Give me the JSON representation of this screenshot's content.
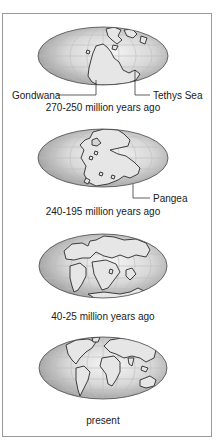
{
  "panels": [
    {
      "id": "p1",
      "caption": "270-250 million years ago",
      "labels": [
        {
          "text": "Gondwana",
          "side": "left"
        },
        {
          "text": "Tethys Sea",
          "side": "right"
        }
      ]
    },
    {
      "id": "p2",
      "caption": "240-195 million years ago",
      "labels": [
        {
          "text": "Pangea",
          "side": "right"
        }
      ]
    },
    {
      "id": "p3",
      "caption": "40-25 million years ago",
      "labels": []
    },
    {
      "id": "p4",
      "caption": "present",
      "labels": []
    }
  ],
  "colors": {
    "frame": "#9a9a9a",
    "globe_center": "#f4f4f4",
    "globe_edge": "#9c9c9c",
    "outline": "#2a2a2a",
    "grid": "#bdbdbd",
    "text": "#1a1a1a"
  }
}
